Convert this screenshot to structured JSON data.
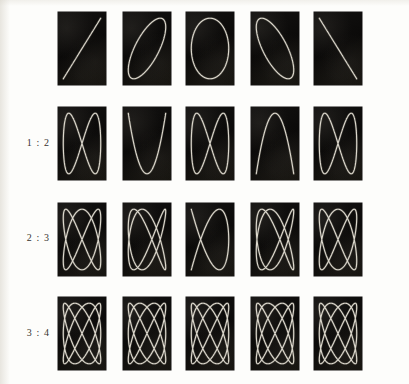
{
  "plate": {
    "title": "Lissajous Figures",
    "background_color": "#fdfdfb",
    "panel_color": "#0d0c0b",
    "curve_color": "#e8e4d8",
    "columns": 5,
    "rows": 4,
    "geometry": {
      "panel_width": 48,
      "panel_height": 73,
      "column_pitch": 64,
      "row_pitch": 95,
      "first_panel_x": 58,
      "first_panel_y": 12,
      "label_x": 10,
      "label_width": 40
    },
    "phase_labels": [
      "0",
      "1/8",
      "1/4",
      "3/8",
      "1/2"
    ]
  },
  "rows": [
    {
      "label": "",
      "ratio_x": 1,
      "ratio_y": 1,
      "label_visible": false,
      "panels": [
        {
          "name": "lissajous-1-1-phase-0",
          "freq_x": 1,
          "freq_y": 1,
          "phase_pi": 0.0,
          "shape": "diagonal-line-up"
        },
        {
          "name": "lissajous-1-1-phase-1-8",
          "freq_x": 1,
          "freq_y": 1,
          "phase_pi": 0.25,
          "shape": "narrow-tilted-ellipse"
        },
        {
          "name": "lissajous-1-1-phase-1-4",
          "freq_x": 1,
          "freq_y": 1,
          "phase_pi": 0.5,
          "shape": "upright-ellipse"
        },
        {
          "name": "lissajous-1-1-phase-3-8",
          "freq_x": 1,
          "freq_y": 1,
          "phase_pi": 0.75,
          "shape": "narrow-tilted-ellipse-mirrored"
        },
        {
          "name": "lissajous-1-1-phase-1-2",
          "freq_x": 1,
          "freq_y": 1,
          "phase_pi": 1.0,
          "shape": "diagonal-line-down"
        }
      ]
    },
    {
      "label": "1 : 2",
      "ratio_x": 1,
      "ratio_y": 2,
      "label_visible": true,
      "panels": [
        {
          "name": "lissajous-1-2-phase-0",
          "freq_x": 1,
          "freq_y": 2,
          "phase_pi": 0.0,
          "shape": "figure-eight"
        },
        {
          "name": "lissajous-1-2-phase-1-8",
          "freq_x": 1,
          "freq_y": 2,
          "phase_pi": 0.25,
          "shape": "open-s-curve"
        },
        {
          "name": "lissajous-1-2-phase-1-4",
          "freq_x": 1,
          "freq_y": 2,
          "phase_pi": 0.5,
          "shape": "parabola-arc"
        },
        {
          "name": "lissajous-1-2-phase-3-8",
          "freq_x": 1,
          "freq_y": 2,
          "phase_pi": 0.75,
          "shape": "open-s-curve-mirrored"
        },
        {
          "name": "lissajous-1-2-phase-1-2",
          "freq_x": 1,
          "freq_y": 2,
          "phase_pi": 1.0,
          "shape": "figure-eight-mirrored"
        }
      ]
    },
    {
      "label": "2 : 3",
      "ratio_x": 2,
      "ratio_y": 3,
      "label_visible": true,
      "panels": [
        {
          "name": "lissajous-2-3-phase-0",
          "freq_x": 2,
          "freq_y": 3,
          "phase_pi": 0.0,
          "shape": "three-lobe-weave"
        },
        {
          "name": "lissajous-2-3-phase-1-8",
          "freq_x": 2,
          "freq_y": 3,
          "phase_pi": 0.25,
          "shape": "three-lobe-weave-skewed"
        },
        {
          "name": "lissajous-2-3-phase-1-4",
          "freq_x": 2,
          "freq_y": 3,
          "phase_pi": 0.5,
          "shape": "single-loop-cross"
        },
        {
          "name": "lissajous-2-3-phase-3-8",
          "freq_x": 2,
          "freq_y": 3,
          "phase_pi": 0.75,
          "shape": "three-lobe-weave-skewed-mirrored"
        },
        {
          "name": "lissajous-2-3-phase-1-2",
          "freq_x": 2,
          "freq_y": 3,
          "phase_pi": 1.0,
          "shape": "three-lobe-weave-mirrored"
        }
      ]
    },
    {
      "label": "3 : 4",
      "ratio_x": 3,
      "ratio_y": 4,
      "label_visible": true,
      "panels": [
        {
          "name": "lissajous-3-4-phase-0",
          "freq_x": 3,
          "freq_y": 4,
          "phase_pi": 0.0,
          "shape": "dense-lattice"
        },
        {
          "name": "lissajous-3-4-phase-1-8",
          "freq_x": 3,
          "freq_y": 4,
          "phase_pi": 0.25,
          "shape": "dense-lattice-skewed"
        },
        {
          "name": "lissajous-3-4-phase-1-4",
          "freq_x": 3,
          "freq_y": 4,
          "phase_pi": 0.5,
          "shape": "open-cross-loop"
        },
        {
          "name": "lissajous-3-4-phase-3-8",
          "freq_x": 3,
          "freq_y": 4,
          "phase_pi": 0.75,
          "shape": "dense-lattice-skewed-mirrored"
        },
        {
          "name": "lissajous-3-4-phase-1-2",
          "freq_x": 3,
          "freq_y": 4,
          "phase_pi": 1.0,
          "shape": "dense-lattice-mirrored"
        }
      ]
    }
  ],
  "chart_data": {
    "type": "line",
    "xlabel": "",
    "ylabel": "",
    "grid": false,
    "legend_position": "left",
    "row_ratios": [
      "1 : 1",
      "1 : 2",
      "2 : 3",
      "3 : 4"
    ],
    "column_phases_pi": [
      0,
      0.25,
      0.5,
      0.75,
      1.0
    ],
    "column_phase_labels": [
      "0",
      "pi/4",
      "pi/2",
      "3pi/4",
      "pi"
    ],
    "series": [
      {
        "name": "1 : 1",
        "freq_x": 1,
        "freq_y": 1,
        "phases_pi": [
          0,
          0.25,
          0.5,
          0.75,
          1.0
        ]
      },
      {
        "name": "1 : 2",
        "freq_x": 1,
        "freq_y": 2,
        "phases_pi": [
          0,
          0.25,
          0.5,
          0.75,
          1.0
        ]
      },
      {
        "name": "2 : 3",
        "freq_x": 2,
        "freq_y": 3,
        "phases_pi": [
          0,
          0.25,
          0.5,
          0.75,
          1.0
        ]
      },
      {
        "name": "3 : 4",
        "freq_x": 3,
        "freq_y": 4,
        "phases_pi": [
          0,
          0.25,
          0.5,
          0.75,
          1.0
        ]
      }
    ],
    "xlim": [
      -1,
      1
    ],
    "ylim": [
      -1,
      1
    ]
  }
}
